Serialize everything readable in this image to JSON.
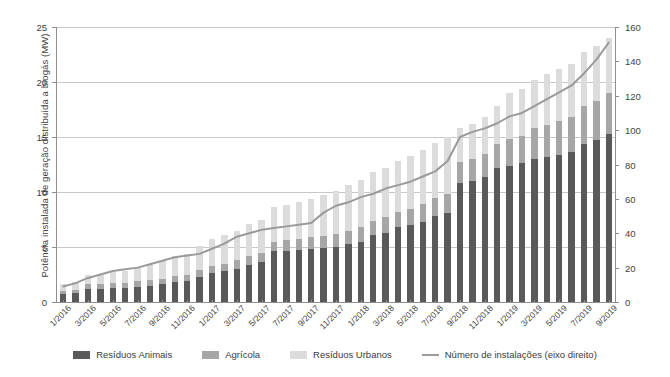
{
  "chart_data": {
    "type": "bar",
    "subtype": "stacked-bar-with-line-overlay",
    "title": "",
    "xlabel": "",
    "ylabel": "Potência instalada de geração distribuída a biogás (MW)",
    "y2label": "Número de instalações",
    "ylim": [
      0,
      25
    ],
    "y2lim": [
      0,
      160
    ],
    "yticks": [
      0,
      5,
      10,
      15,
      20,
      25
    ],
    "y2ticks": [
      0,
      20,
      40,
      60,
      80,
      100,
      120,
      140,
      160
    ],
    "grid": true,
    "legend_position": "bottom",
    "categories": [
      "1/2016",
      "2/2016",
      "3/2016",
      "4/2016",
      "5/2016",
      "6/2016",
      "7/2016",
      "8/2016",
      "9/2016",
      "10/2016",
      "11/2016",
      "12/2016",
      "1/2017",
      "2/2017",
      "3/2017",
      "4/2017",
      "5/2017",
      "6/2017",
      "7/2017",
      "8/2017",
      "9/2017",
      "10/2017",
      "11/2017",
      "12/2017",
      "1/2018",
      "2/2018",
      "3/2018",
      "4/2018",
      "5/2018",
      "6/2018",
      "7/2018",
      "8/2018",
      "9/2018",
      "10/2018",
      "11/2018",
      "12/2018",
      "1/2019",
      "2/2019",
      "3/2019",
      "4/2019",
      "5/2019",
      "6/2019",
      "7/2019",
      "8/2019",
      "9/2019"
    ],
    "xtick_labels": [
      "1/2016",
      "3/2016",
      "5/2016",
      "7/2016",
      "9/2016",
      "11/2016",
      "1/2017",
      "3/2017",
      "5/2017",
      "7/2017",
      "9/2017",
      "11/2017",
      "1/2018",
      "3/2018",
      "5/2018",
      "7/2018",
      "9/2018",
      "11/2018",
      "1/2019",
      "3/2019",
      "5/2019",
      "7/2019",
      "9/2019"
    ],
    "xtick_indices": [
      0,
      2,
      4,
      6,
      8,
      10,
      12,
      14,
      16,
      18,
      20,
      22,
      24,
      26,
      28,
      30,
      32,
      34,
      36,
      38,
      40,
      42,
      44
    ],
    "series": [
      {
        "name": "Resíduos Animais",
        "color": "#595959",
        "values": [
          0.7,
          0.8,
          1.2,
          1.2,
          1.3,
          1.3,
          1.4,
          1.5,
          1.6,
          1.8,
          1.9,
          2.3,
          2.6,
          2.8,
          3.0,
          3.4,
          3.6,
          4.6,
          4.6,
          4.7,
          4.8,
          4.9,
          5.0,
          5.3,
          5.5,
          6.1,
          6.3,
          6.8,
          7.0,
          7.3,
          7.8,
          8.1,
          10.8,
          11.0,
          11.4,
          12.2,
          12.4,
          12.6,
          13.0,
          13.2,
          13.4,
          13.6,
          14.4,
          14.7,
          15.3
        ]
      },
      {
        "name": "Agrícola",
        "color": "#a6a6a6",
        "values": [
          0.3,
          0.3,
          0.4,
          0.4,
          0.4,
          0.4,
          0.5,
          0.5,
          0.5,
          0.6,
          0.6,
          0.6,
          0.7,
          0.7,
          0.8,
          0.8,
          0.9,
          0.9,
          1.0,
          1.0,
          1.1,
          1.1,
          1.2,
          1.2,
          1.3,
          1.3,
          1.4,
          1.4,
          1.5,
          1.6,
          1.7,
          1.7,
          1.9,
          2.0,
          2.1,
          2.2,
          2.4,
          2.5,
          2.8,
          2.9,
          3.1,
          3.2,
          3.4,
          3.6,
          3.7
        ]
      },
      {
        "name": "Resíduos Urbanos",
        "color": "#dcdcdc",
        "values": [
          0.6,
          0.7,
          0.9,
          0.9,
          1.0,
          1.1,
          1.3,
          1.4,
          1.6,
          1.8,
          1.9,
          2.2,
          2.4,
          2.6,
          2.7,
          2.9,
          3.0,
          3.1,
          3.2,
          3.4,
          3.5,
          3.7,
          3.9,
          4.1,
          4.3,
          4.4,
          4.5,
          4.6,
          4.8,
          4.9,
          5.0,
          5.2,
          3.1,
          3.2,
          3.3,
          3.4,
          4.2,
          4.3,
          4.4,
          4.6,
          4.7,
          4.8,
          4.9,
          5.0,
          5.0
        ]
      }
    ],
    "line_series": {
      "name": "Número de instalações (eixo direito)",
      "axis": "right",
      "color": "#9a9a9a",
      "values": [
        9,
        11,
        14,
        16,
        18,
        19,
        20,
        22,
        24,
        26,
        27,
        28,
        31,
        34,
        38,
        40,
        42,
        43,
        44,
        45,
        46,
        52,
        56,
        58,
        61,
        63,
        66,
        68,
        70,
        73,
        76,
        82,
        96,
        99,
        101,
        104,
        108,
        110,
        114,
        118,
        122,
        126,
        133,
        141,
        151
      ]
    }
  },
  "legend": {
    "items": [
      {
        "label": "Resíduos Animais",
        "swatch": "fill",
        "color": "#595959"
      },
      {
        "label": "Agrícola",
        "swatch": "fill",
        "color": "#a6a6a6"
      },
      {
        "label": "Resíduos Urbanos",
        "swatch": "fill",
        "color": "#dcdcdc"
      },
      {
        "label": "Número de instalações (eixo direito)",
        "swatch": "line",
        "color": "#9a9a9a"
      }
    ]
  }
}
